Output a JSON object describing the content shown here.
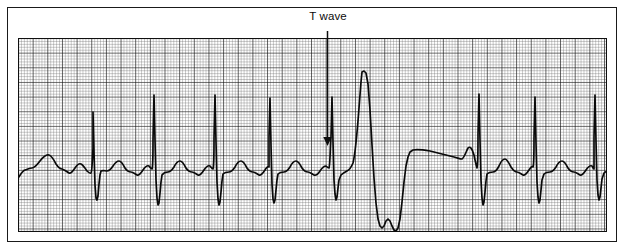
{
  "figure": {
    "kind": "ecg-rhythm-strip",
    "width": 625,
    "height": 252,
    "background": "#ffffff",
    "frame": {
      "name": "outer-frame",
      "color": "#1a1a1a",
      "x": 7,
      "y": 7,
      "w": 610,
      "h": 235
    }
  },
  "annotations": {
    "t_wave": {
      "label": "T wave",
      "text_color": "#0d0d0d",
      "font_size_px": 11.5,
      "text_center_x": 328,
      "text_y": 10,
      "arrow": {
        "name": "t-wave-arrow",
        "color": "#0d0d0d",
        "x": 327.5,
        "y_start": 31,
        "y_end": 146,
        "head_half_width": 4.2,
        "head_length": 9,
        "stroke_width": 1.5
      }
    }
  },
  "grid": {
    "name": "ecg-graph-paper",
    "x": 18,
    "y": 38,
    "w": 589,
    "h": 194,
    "minor_step_px": 2.93,
    "major_every": 5,
    "minor_color": "#5e5e5e",
    "major_color": "#0f0f0f",
    "minor_width": 0.55,
    "major_width": 1.05,
    "paper_color": "#ffffff"
  },
  "chart_data": {
    "type": "line",
    "title": "",
    "subtitle": "",
    "xlabel": "",
    "ylabel": "",
    "grid": true,
    "legend": null,
    "annotations": [
      {
        "text": "T wave",
        "points_to_x": 327,
        "points_to_y": 146
      }
    ],
    "series": [
      {
        "name": "ECG lead II rhythm strip",
        "stroke": "#0a0a0a",
        "stroke_width": 1.7,
        "baseline_y": 168,
        "beats": [
          {
            "type": "sinus",
            "r_peak_x": 75,
            "r_peak_y": 112,
            "s_trough_y": 198
          },
          {
            "type": "sinus",
            "r_peak_x": 135,
            "r_peak_y": 95,
            "s_trough_y": 205
          },
          {
            "type": "sinus",
            "r_peak_x": 195,
            "r_peak_y": 95,
            "s_trough_y": 205
          },
          {
            "type": "sinus",
            "r_peak_x": 251,
            "r_peak_y": 98,
            "s_trough_y": 203
          },
          {
            "type": "sinus",
            "r_peak_x": 313,
            "r_peak_y": 97,
            "s_trough_y": 200
          },
          {
            "type": "pvc",
            "r_peak_x": 344,
            "r_peak_y": 72,
            "s_trough_y": 228
          },
          {
            "type": "sinus",
            "r_peak_x": 460,
            "r_peak_y": 94,
            "s_trough_y": 205
          },
          {
            "type": "sinus",
            "r_peak_x": 516,
            "r_peak_y": 97,
            "s_trough_y": 203
          },
          {
            "type": "sinus",
            "r_peak_x": 576,
            "r_peak_y": 95,
            "s_trough_y": 200
          }
        ],
        "path": "M 0 178 C 2 176 4 171 7 170 C 10 169 12 168 14 168 C 17 168 19 165 22 161 C 25 157 28 154 31 155 C 34 156 36 160 38 164 C 40 167 42 169 44 169 C 47 170 49 172 51 173 C 53 174 55 171 57 168 C 59 165 61 163 63 164 C 65 165 67 168 69 171 C 71 173 72 174 73 173 C 74 172 74 166 75 148 L 75 112 L 76 152 L 77 185 L 78 198 L 79 200 L 80 196 L 81 184 L 82 175 L 83 171 C 85 170 87 171 89 171 C 91 171 93 169 95 166 C 97 163 99 161 101 161 C 103 161 105 164 107 168 C 109 171 111 172 113 172 C 115 172 117 174 119 175 C 121 176 123 173 125 170 C 127 167 129 165 131 166 C 132 167 133 169 134 169 C 135 167 135 156 135 140 L 136 95 L 137 140 L 138 180 L 139 198 L 140 205 L 141 203 L 142 193 L 143 182 L 144 175 C 146 172 148 172 150 172 C 152 172 154 170 156 167 C 158 163 160 161 162 161 C 164 161 166 164 168 168 C 170 171 172 172 174 172 C 176 172 178 174 180 175 C 182 176 184 173 186 170 C 188 167 190 165 192 166 C 193 167 194 169 195 169 C 196 166 196 154 196 138 L 197 95 L 198 142 L 199 182 L 200 199 L 201 205 L 202 202 L 203 192 L 204 181 L 205 174 C 207 172 209 172 211 172 C 213 172 215 170 217 167 C 219 163 221 161 223 161 C 225 161 227 164 229 168 C 231 171 233 172 235 172 C 237 172 239 174 241 175 C 243 176 245 173 247 170 C 248 168 250 166 251 167 C 251 164 251 150 251 136 L 252 98 L 253 145 L 254 184 L 255 199 L 256 203 L 257 200 L 258 190 L 259 180 L 260 174 C 262 172 264 172 266 172 C 268 172 270 170 272 167 C 274 163 276 161 278 161 C 280 161 282 164 284 168 C 286 171 288 172 290 172 C 292 172 294 174 296 175 C 298 176 300 174 302 171 C 304 168 306 166 308 166 C 309 167 310 168 311 168 C 312 166 312 152 313 137 L 314 97 L 315 142 L 316 180 L 317 194 L 318 200 L 319 197 L 320 188 L 321 180 L 323 175 C 325 173 327 172 329 171 C 331 170 333 168 335 163 C 337 155 339 135 341 108 L 343 82 L 344 72 L 346 71 L 348 73 L 350 84 L 352 110 L 354 145 L 356 178 L 358 203 L 360 219 L 362 226 L 364 228 L 366 226 L 368 221 L 370 219 L 372 221 L 374 226 L 376 230 L 378 231 L 380 228 L 382 219 L 384 202 L 386 182 L 388 166 L 390 157 L 392 152 L 395 150 C 400 149 406 150 412 151 C 420 153 428 155 436 157 C 440 158 442 159 444 159 C 446 158 448 152 450 148 C 452 146 454 148 456 155 C 457 160 458 165 459 168 C 460 165 460 150 460 134 L 461 94 L 462 140 L 463 180 L 464 198 L 465 205 L 466 202 L 467 192 L 468 181 L 469 174 C 471 172 473 172 475 172 C 477 172 479 170 481 166 C 483 161 485 159 487 159 C 489 159 491 163 493 167 C 495 170 497 172 499 172 C 501 172 503 174 505 175 C 507 176 509 173 511 170 C 513 167 514 166 515 167 C 516 165 516 152 516 138 L 517 97 L 518 143 L 519 182 L 520 197 L 521 203 L 522 200 L 523 190 L 524 180 L 526 174 C 528 172 530 172 532 172 C 534 172 536 170 538 167 C 540 163 542 161 544 161 C 546 161 548 164 550 168 C 552 171 554 172 556 172 C 558 172 560 174 562 175 C 564 176 566 173 568 170 C 570 167 572 165 574 166 C 575 167 575 169 576 169 C 576 166 576 153 576 137 L 577 95 L 578 141 L 579 180 L 580 195 L 581 200 L 582 197 L 583 188 L 584 179 L 586 173 C 588 171 590 171 592 171 C 594 171 596 169 598 166 C 600 163 602 161 604 161 C 606 161 608 164 610 168"
      }
    ]
  }
}
